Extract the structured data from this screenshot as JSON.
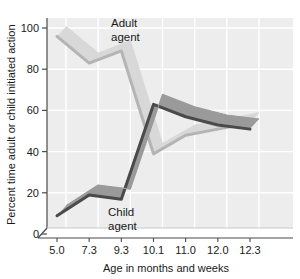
{
  "chart_data": {
    "type": "line",
    "title": "",
    "xlabel": "Age in months and weeks",
    "ylabel": "Percent time adult or child initiated action",
    "categories": [
      "5.0",
      "7.3",
      "9.3",
      "10.1",
      "11.0",
      "12.0",
      "12.3"
    ],
    "ylim": [
      0,
      100
    ],
    "yticks": [
      "0",
      "20",
      "40",
      "60",
      "80",
      "100"
    ],
    "ytick_values": [
      0,
      20,
      40,
      60,
      80,
      100
    ],
    "grid": true,
    "legend_position": "inline-annotation",
    "style": "3d-ribbon",
    "series": [
      {
        "name": "Adult agent",
        "color": "#b4b4b4",
        "values": [
          93,
          80,
          86,
          36,
          45,
          48,
          51
        ]
      },
      {
        "name": "Child agent",
        "color": "#4a4a4a",
        "values": [
          6,
          16,
          14,
          60,
          54,
          50,
          48
        ]
      }
    ],
    "annotations": [
      {
        "text_line1": "Adult",
        "text_line2": "agent",
        "series": "Adult agent"
      },
      {
        "text_line1": "Child",
        "text_line2": "agent",
        "series": "Child agent"
      }
    ],
    "colors": {
      "plot_background": "#ededed",
      "gridline": "#ffffff",
      "axis": "#4a4a4a",
      "adult_series": "#b4b4b4",
      "adult_series_top": "#d8d8d8",
      "child_series": "#4a4a4a",
      "child_series_top": "#707070",
      "text": "#1a1a1a"
    }
  }
}
